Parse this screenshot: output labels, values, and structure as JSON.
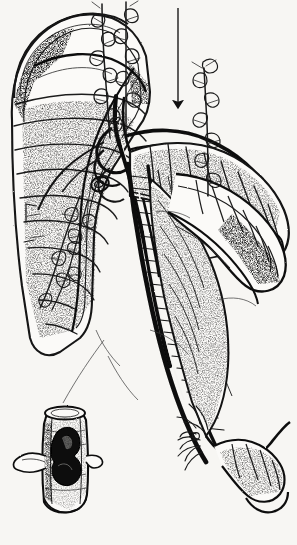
{
  "figure": {
    "domain": "Natural-Image",
    "kind": "anatomical-line-drawing",
    "title": "Pen-and-ink anatomical illustration of duodenum, pancreas and mesenteric vessels with lymph node chains",
    "medium": "black ink line engraving on off-white paper",
    "background_color": "#f7f6f3",
    "ink_color": "#111111",
    "stipple_color": "#4a4a4a",
    "width_px": 297,
    "height_px": 545,
    "text_present": "none",
    "annotations": {
      "arrow": {
        "name": "downward-pointing-arrow",
        "direction": "down",
        "x": 178,
        "y_start": 8,
        "y_end": 107,
        "color": "#1a1a1a",
        "shaft_width_px": 1.3,
        "head_width_px": 7,
        "head_length_px": 9
      },
      "leader_line": {
        "name": "inset-leader-line",
        "from_x": 104,
        "from_y": 340,
        "to_x": 62,
        "to_y": 404,
        "color": "#555555",
        "stroke_width_px": 0.8
      }
    },
    "parts": [
      {
        "id": "duodenum",
        "label": "duodenum / bowel loop",
        "region": "upper-left",
        "bbox": [
          6,
          14,
          150,
          330
        ],
        "shading": "transverse segmental banding with stipple"
      },
      {
        "id": "pancreas-body",
        "label": "pancreas body and tail",
        "region": "center-right",
        "bbox": [
          140,
          130,
          290,
          230
        ],
        "shading": "dense stipple"
      },
      {
        "id": "mesenteric-vessels",
        "label": "superior mesenteric artery and vein",
        "region": "center",
        "bbox": [
          100,
          120,
          230,
          470
        ],
        "shading": "paired tubular vessels with cross hatching"
      },
      {
        "id": "lymph-chain-upper",
        "label": "upper lymph node chain",
        "region": "top-center",
        "bbox": [
          86,
          0,
          146,
          140
        ]
      },
      {
        "id": "lymph-chain-right",
        "label": "right lymph node chain",
        "region": "upper-right",
        "bbox": [
          186,
          60,
          238,
          200
        ]
      },
      {
        "id": "lymph-chain-left",
        "label": "left mesenteric lymph chain",
        "region": "mid-left",
        "bbox": [
          18,
          160,
          90,
          300
        ]
      },
      {
        "id": "distal-branches",
        "label": "distal arterial branches",
        "region": "lower-right",
        "bbox": [
          185,
          400,
          290,
          530
        ]
      },
      {
        "id": "inset-vessel",
        "label": "inset: vessel segment with dark tumour thrombus",
        "region": "lower-left",
        "bbox": [
          18,
          400,
          104,
          512
        ],
        "thrombus_color": "#080808"
      }
    ]
  }
}
